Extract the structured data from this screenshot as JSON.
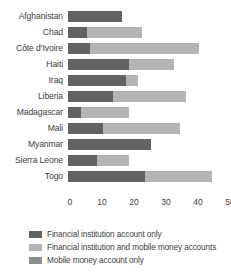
{
  "chart_data": {
    "type": "bar",
    "orientation": "horizontal",
    "stacked": true,
    "title": "",
    "xlabel": "",
    "ylabel": "",
    "xlim": [
      0,
      50
    ],
    "xticks": [
      0,
      10,
      20,
      30,
      40,
      50
    ],
    "grid": false,
    "legend_position": "bottom-left",
    "categories": [
      "Afghanistan",
      "Chad",
      "Côte d’Ivoire",
      "Haiti",
      "Iraq",
      "Liberia",
      "Madagascar",
      "Mali",
      "Myanmar",
      "Sierra Leone",
      "Togo"
    ],
    "series": [
      {
        "name": "Financial institution account only",
        "color": "#636363",
        "values": [
          17,
          6,
          7,
          19,
          18,
          14,
          4,
          11,
          26,
          9,
          24
        ]
      },
      {
        "name": "Financial institution and mobile money accounts",
        "color": "#b4b4b4",
        "values": [
          0,
          17,
          34,
          14,
          4,
          23,
          15,
          24,
          0,
          10,
          21
        ]
      },
      {
        "name": "Mobile money account only",
        "color": "#8c8c8c",
        "values": [
          0,
          0,
          0,
          0,
          0,
          0,
          0,
          0,
          0,
          0,
          0
        ]
      }
    ],
    "totals": [
      17,
      23,
      41,
      33,
      22,
      37,
      19,
      35,
      26,
      19,
      45
    ]
  },
  "legend": {
    "items": [
      {
        "label": "Financial institution account only",
        "color": "#636363"
      },
      {
        "label": "Financial institution and mobile money accounts",
        "color": "#b4b4b4"
      },
      {
        "label": "Mobile money account only",
        "color": "#8c8c8c"
      }
    ]
  },
  "axis": {
    "ticks": [
      "0",
      "10",
      "20",
      "30",
      "40",
      "50"
    ]
  }
}
